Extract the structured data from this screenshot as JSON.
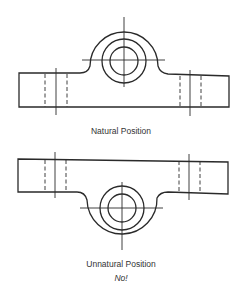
{
  "figure": {
    "views": [
      {
        "id": "natural",
        "caption": "Natural Position",
        "orientation": "boss-up"
      },
      {
        "id": "unnatural",
        "caption": "Unnatural Position",
        "note": "No!",
        "orientation": "boss-down"
      }
    ],
    "colors": {
      "line": "#2a2a2a",
      "text": "#333333",
      "background": "#ffffff"
    }
  }
}
